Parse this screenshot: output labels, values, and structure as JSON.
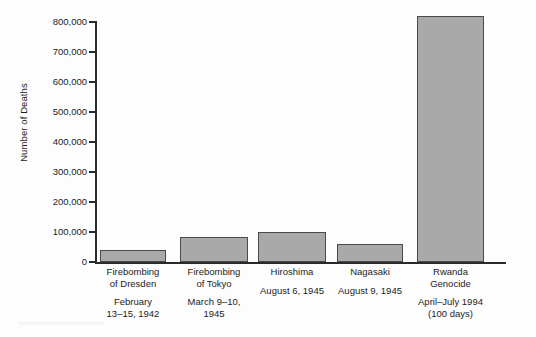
{
  "chart_data": {
    "type": "bar",
    "title": "",
    "xlabel": "",
    "ylabel": "Number of Deaths",
    "ylim": [
      0,
      800000
    ],
    "ytick_step": 100000,
    "grid": false,
    "legend": null,
    "categories": [
      "Firebombing of Dresden",
      "Firebombing of Tokyo",
      "Hiroshima",
      "Nagasaki",
      "Rwanda Genocide"
    ],
    "values": [
      40000,
      85000,
      100000,
      60000,
      820000
    ],
    "ytick_labels": [
      "0",
      "100,000",
      "200,000",
      "300,000",
      "400,000",
      "500,000",
      "600,000",
      "700,000",
      "800,000"
    ],
    "ytick_values": [
      0,
      100000,
      200000,
      300000,
      400000,
      500000,
      600000,
      700000,
      800000
    ],
    "bar_color": "#a9a9a9",
    "bar_edge_color": "#4a4a4a",
    "axis_color": "#2b2b2b"
  },
  "categories": [
    {
      "name_line1": "Firebombing",
      "name_line2": "of Dresden",
      "date_line1": "February",
      "date_line2": "13–15, 1942"
    },
    {
      "name_line1": "Firebombing",
      "name_line2": "of Tokyo",
      "date_line1": "March 9–10,",
      "date_line2": "1945"
    },
    {
      "name_line1": "Hiroshima",
      "name_line2": "",
      "date_line1": "August 6, 1945",
      "date_line2": ""
    },
    {
      "name_line1": "Nagasaki",
      "name_line2": "",
      "date_line1": "August 9, 1945",
      "date_line2": ""
    },
    {
      "name_line1": "Rwanda",
      "name_line2": "Genocide",
      "date_line1": "April–July 1994",
      "date_line2": "(100 days)"
    }
  ],
  "axis": {
    "y_title": "Number of Deaths"
  }
}
